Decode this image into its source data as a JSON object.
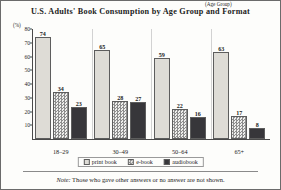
{
  "chart_data": {
    "type": "bar",
    "title": "U.S. Adults' Book Consumption by Age Group and Format",
    "xlabel": "(Age Group)",
    "ylabel": "(%)",
    "categories": [
      "18–29",
      "30–49",
      "50–64",
      "65+"
    ],
    "series": [
      {
        "name": "print book",
        "values": [
          74,
          65,
          59,
          63
        ],
        "color": "#dedcd6"
      },
      {
        "name": "e-book",
        "values": [
          34,
          28,
          22,
          17
        ],
        "color": "#8d8d8d"
      },
      {
        "name": "audiobook",
        "values": [
          23,
          27,
          16,
          8
        ],
        "color": "#37363a"
      }
    ],
    "ylim": [
      0,
      80
    ],
    "yticks": [
      10,
      20,
      30,
      40,
      50,
      60,
      70,
      80
    ],
    "grid": false,
    "legend_position": "bottom",
    "note_label": "Note:",
    "note_text": " Those who gave other answers or no answer are not shown."
  }
}
